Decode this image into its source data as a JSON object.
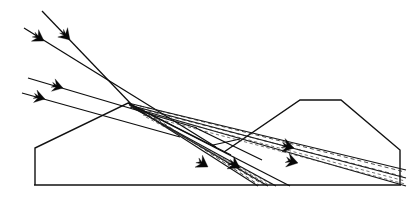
{
  "figure": {
    "kind": "line-diagram",
    "background_color": "#ffffff",
    "line_color": "#0d0d0d",
    "dashed_line_color": "#2b2b2b",
    "canvas": {
      "width": 409,
      "height": 203
    }
  },
  "geometry": {
    "ground_line": {
      "x1": 35,
      "y1": 185,
      "x2": 400,
      "y2": 185
    },
    "left_massif_outline": "35,185 35,148 128,103 230,155",
    "right_peak_outline": "232,156 300,100 340,100 400,150 400,185",
    "convergence_node": {
      "x": 128,
      "y": 103,
      "label": "upper-convergence-point"
    },
    "secondary_node": {
      "x": 213,
      "y": 145,
      "label": "lower-crossing-point"
    }
  },
  "incident_rays": [
    {
      "id": "ray-1",
      "x1": 42,
      "y1": 11,
      "x2": 128,
      "y2": 103,
      "arrow_at": [
        68,
        36
      ]
    },
    {
      "id": "ray-2",
      "x1": 24,
      "y1": 28,
      "x2": 213,
      "y2": 145,
      "arrow_at": [
        42,
        39
      ]
    },
    {
      "id": "ray-3",
      "x1": 28,
      "y1": 78,
      "x2": 193,
      "y2": 126,
      "arrow_at": [
        62,
        88
      ]
    },
    {
      "id": "ray-4",
      "x1": 22,
      "y1": 93,
      "x2": 175,
      "y2": 135,
      "arrow_at": [
        44,
        99
      ]
    }
  ],
  "exit_bundles": [
    {
      "id": "bundle-right",
      "description": "Wide refracted bundle travelling right and slightly down past the right peak",
      "from": {
        "x": 128,
        "y": 103
      },
      "to": {
        "x": 405,
        "y": 182
      },
      "arrows": [
        [
          290,
          148
        ],
        [
          294,
          162
        ]
      ],
      "dashed_line_count": 4
    },
    {
      "id": "bundle-down",
      "description": "Steeper refracted bundle descending to the base line",
      "from": {
        "x": 128,
        "y": 103
      },
      "to": {
        "x": 268,
        "y": 186
      },
      "arrows": [
        [
          204,
          166
        ],
        [
          236,
          167
        ]
      ],
      "dashed_line_count": 4
    }
  ],
  "arrowheads": {
    "style": "swept-barb",
    "count": 8,
    "fill_color": "#080808"
  },
  "labels": [],
  "caption": ""
}
